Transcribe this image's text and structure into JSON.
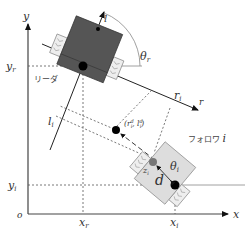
{
  "axes": {
    "x_label": "x",
    "y_label": "y",
    "origin_label": "o"
  },
  "leader": {
    "name": "リーダ",
    "x_label": "x",
    "x_sub": "r",
    "y_label": "y",
    "y_sub": "r",
    "theta_label": "θ",
    "theta_sub": "r",
    "body_color": "#555555"
  },
  "relative_axes": {
    "r_axis": "r",
    "l_axis": "l",
    "r_i_label": "r",
    "r_i_sub": "i",
    "l_i_label": "l",
    "l_i_sub": "i"
  },
  "desired_point": {
    "label": "(r",
    "sup1": "d",
    "sub1": "i",
    "mid": ", l",
    "sup2": "d",
    "sub2": "i",
    "end": ")"
  },
  "follower": {
    "name": "フォロワ",
    "index": "i",
    "x_label": "x",
    "x_sub": "i",
    "y_label": "y",
    "y_sub": "i",
    "z_label": "z",
    "z_sub": "i",
    "theta_label": "θ",
    "theta_sub": "i",
    "d_label": "d",
    "body_color": "#dddddd"
  }
}
